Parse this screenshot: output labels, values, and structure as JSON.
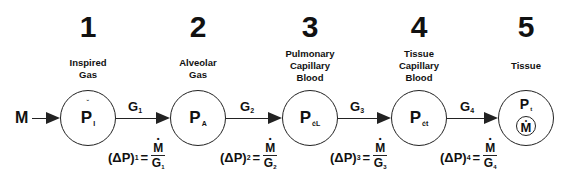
{
  "diagram": {
    "input_flux": "M",
    "compartments": [
      {
        "number": "1",
        "label_lines": [
          "Inspired",
          "Gas"
        ],
        "symbol": "P",
        "subscript": "I",
        "x": 88
      },
      {
        "number": "2",
        "label_lines": [
          "Alveolar",
          "Gas"
        ],
        "symbol": "P",
        "subscript": "A",
        "x": 198
      },
      {
        "number": "3",
        "label_lines": [
          "Pulmonary",
          "Capillary",
          "Blood"
        ],
        "symbol": "P",
        "subscript": "ćL",
        "x": 310
      },
      {
        "number": "4",
        "label_lines": [
          "Tissue",
          "Capillary",
          "Blood"
        ],
        "symbol": "P",
        "subscript": "ćt",
        "x": 419
      },
      {
        "number": "5",
        "label_lines": [
          "Tissue"
        ],
        "symbol": "P",
        "subscript": "t",
        "inner_symbol": "M",
        "x": 526
      }
    ],
    "conductances": [
      {
        "symbol": "G",
        "subscript": "1"
      },
      {
        "symbol": "G",
        "subscript": "2"
      },
      {
        "symbol": "G",
        "subscript": "3"
      },
      {
        "symbol": "G",
        "subscript": "4"
      }
    ],
    "formulas": [
      {
        "lhs": "(ΔP)",
        "lhs_sub": "1",
        "eq": "=",
        "num": "M",
        "den": "G",
        "den_sub": "1"
      },
      {
        "lhs": "(ΔP)",
        "lhs_sub": "2",
        "eq": "=",
        "num": "M",
        "den": "G",
        "den_sub": "2"
      },
      {
        "lhs": "(ΔP)",
        "lhs_sub": "3",
        "eq": "=",
        "num": "M",
        "den": "G",
        "den_sub": "3"
      },
      {
        "lhs": "(ΔP)",
        "lhs_sub": "4",
        "eq": "=",
        "num": "M",
        "den": "G",
        "den_sub": "4"
      }
    ],
    "colors": {
      "ink": "#222222",
      "background": "#ffffff"
    }
  }
}
